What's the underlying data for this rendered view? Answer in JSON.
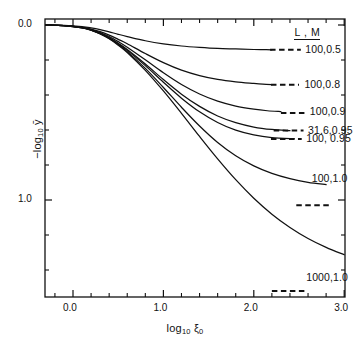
{
  "chart_data": {
    "type": "line",
    "title": "",
    "xlabel": "log10 xi_0",
    "ylabel": "-log10 y-bar",
    "xlabel_parts": {
      "prefix": "log",
      "prefix_sub": "10",
      "symbol": "ξ",
      "symbol_sub": "0"
    },
    "ylabel_parts": {
      "minus": "−",
      "prefix": "log",
      "prefix_sub": "10",
      "symbol": "ȳ"
    },
    "xlim": [
      -0.35,
      3.05
    ],
    "ylim": [
      1.58,
      -0.04
    ],
    "y_axis_direction": "downward-increasing",
    "grid": false,
    "legend_position": "right-inside",
    "legend_header": "L , M",
    "xticks_major": [
      0.0,
      1.0,
      2.0,
      3.0
    ],
    "xticklabels": [
      "0.0",
      "1.0",
      "2.0",
      "3.0"
    ],
    "xticks_minor": [
      -0.2,
      0.2,
      0.4,
      0.6,
      0.8,
      1.2,
      1.4,
      1.6,
      1.8,
      2.2,
      2.4,
      2.6,
      2.8
    ],
    "yticks_major": [
      0.0,
      1.0
    ],
    "yticklabels": [
      "0.0",
      "1.0"
    ],
    "yticks_minor": [
      0.2,
      0.4,
      0.6,
      0.8,
      1.2,
      1.4
    ],
    "series": [
      {
        "name": "100,0.5",
        "label": "100,0.5",
        "L": 100,
        "M": 0.5,
        "asymptote": 0.142,
        "x": [
          -0.3,
          -0.1,
          0.1,
          0.2,
          0.3,
          0.4,
          0.5,
          0.6,
          0.8,
          1.0,
          1.2,
          1.4,
          1.6,
          1.8,
          2.0,
          2.1,
          2.2
        ],
        "y": [
          0.0,
          0.002,
          0.009,
          0.016,
          0.026,
          0.039,
          0.053,
          0.066,
          0.09,
          0.108,
          0.12,
          0.128,
          0.134,
          0.137,
          0.14,
          0.141,
          0.142
        ],
        "dash_x": [
          2.18,
          2.52
        ],
        "dash_y": 0.142,
        "label_x": 2.57,
        "label_y": 0.142
      },
      {
        "name": "100,0.8",
        "label": "100,0.8",
        "L": 100,
        "M": 0.8,
        "asymptote": 0.342,
        "x": [
          -0.3,
          -0.1,
          0.1,
          0.2,
          0.3,
          0.4,
          0.5,
          0.6,
          0.8,
          1.0,
          1.2,
          1.4,
          1.6,
          1.8,
          2.0,
          2.1,
          2.2
        ],
        "y": [
          0.0,
          0.003,
          0.013,
          0.023,
          0.038,
          0.058,
          0.082,
          0.107,
          0.163,
          0.215,
          0.258,
          0.289,
          0.311,
          0.325,
          0.334,
          0.338,
          0.341
        ],
        "dash_x": [
          2.19,
          2.5
        ],
        "dash_y": 0.342,
        "label_x": 2.56,
        "label_y": 0.342
      },
      {
        "name": "100,0.9",
        "label": "100,0.9",
        "L": 100,
        "M": 0.9,
        "asymptote": 0.497,
        "x": [
          -0.3,
          -0.1,
          0.1,
          0.2,
          0.3,
          0.4,
          0.5,
          0.6,
          0.8,
          1.0,
          1.2,
          1.4,
          1.6,
          1.8,
          2.0,
          2.15,
          2.3
        ],
        "y": [
          0.0,
          0.003,
          0.014,
          0.026,
          0.043,
          0.066,
          0.095,
          0.127,
          0.199,
          0.273,
          0.34,
          0.394,
          0.435,
          0.463,
          0.481,
          0.49,
          0.495
        ],
        "dash_x": [
          2.3,
          2.57
        ],
        "dash_y": 0.503,
        "label_x": 2.62,
        "label_y": 0.497
      },
      {
        "name": "31.6,0.95",
        "label": "31.6,0.95",
        "L": 31.6,
        "M": 0.95,
        "asymptote": 0.606,
        "x": [
          -0.3,
          -0.1,
          0.1,
          0.2,
          0.3,
          0.4,
          0.5,
          0.6,
          0.8,
          1.0,
          1.2,
          1.4,
          1.6,
          1.8,
          2.0,
          2.2,
          2.4
        ],
        "y": [
          0.0,
          0.003,
          0.015,
          0.028,
          0.047,
          0.072,
          0.104,
          0.14,
          0.223,
          0.312,
          0.395,
          0.465,
          0.52,
          0.558,
          0.583,
          0.597,
          0.604
        ],
        "dash_x": [
          2.22,
          2.55
        ],
        "dash_y": 0.603,
        "label_x": 2.6,
        "label_y": 0.603
      },
      {
        "name": "100, 0.95",
        "label": "100, 0.95",
        "L": 100,
        "M": 0.95,
        "asymptote": 0.651,
        "x": [
          -0.3,
          -0.1,
          0.1,
          0.2,
          0.3,
          0.4,
          0.5,
          0.6,
          0.8,
          1.0,
          1.2,
          1.4,
          1.6,
          1.8,
          2.0,
          2.2,
          2.45
        ],
        "y": [
          0.0,
          0.003,
          0.015,
          0.029,
          0.048,
          0.074,
          0.107,
          0.145,
          0.232,
          0.327,
          0.418,
          0.496,
          0.557,
          0.601,
          0.628,
          0.643,
          0.65
        ],
        "dash_x": [
          2.19,
          2.53
        ],
        "dash_y": 0.651,
        "label_x": 2.58,
        "label_y": 0.651
      },
      {
        "name": "100,1.0",
        "label": "100,1.0",
        "L": 100,
        "M": 1.0,
        "asymptote": 1.03,
        "x": [
          -0.3,
          -0.1,
          0.1,
          0.2,
          0.3,
          0.4,
          0.5,
          0.6,
          0.8,
          1.0,
          1.2,
          1.4,
          1.6,
          1.8,
          2.0,
          2.2,
          2.4,
          2.6,
          2.8
        ],
        "y": [
          0.0,
          0.003,
          0.016,
          0.03,
          0.05,
          0.077,
          0.112,
          0.152,
          0.248,
          0.357,
          0.47,
          0.577,
          0.671,
          0.747,
          0.805,
          0.848,
          0.878,
          0.899,
          0.912
        ],
        "dash_x": [
          2.47,
          2.83
        ],
        "dash_y": 1.03,
        "label_x": 2.64,
        "label_y": 0.88
      },
      {
        "name": "1000,1.0",
        "label": "1000,1.0",
        "L": 1000,
        "M": 1.0,
        "asymptote": 1.53,
        "x": [
          -0.3,
          -0.1,
          0.1,
          0.2,
          0.3,
          0.4,
          0.5,
          0.6,
          0.8,
          1.0,
          1.2,
          1.4,
          1.6,
          1.8,
          2.0,
          2.2,
          2.4,
          2.6,
          2.8,
          3.0
        ],
        "y": [
          0.0,
          0.003,
          0.016,
          0.03,
          0.051,
          0.079,
          0.115,
          0.157,
          0.259,
          0.377,
          0.505,
          0.637,
          0.765,
          0.884,
          0.99,
          1.081,
          1.157,
          1.22,
          1.271,
          1.313
        ],
        "dash_x": [
          2.2,
          2.56
        ],
        "dash_y": 1.52,
        "label_x": 2.58,
        "label_y": 1.445
      }
    ]
  },
  "axes": {
    "line_color": "#111111",
    "curve_color": "#111111",
    "background": "#ffffff"
  }
}
